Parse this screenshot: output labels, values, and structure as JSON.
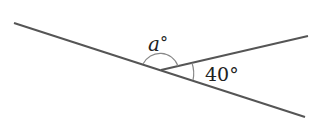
{
  "diagram": {
    "type": "angle-on-straight-line",
    "colors": {
      "line": "#555555",
      "arc": "#888888",
      "text": "#222222"
    },
    "labels": {
      "angle_a": "a°",
      "angle_a_var": "a",
      "angle_a_deg": "°",
      "angle_40": "40°"
    }
  }
}
